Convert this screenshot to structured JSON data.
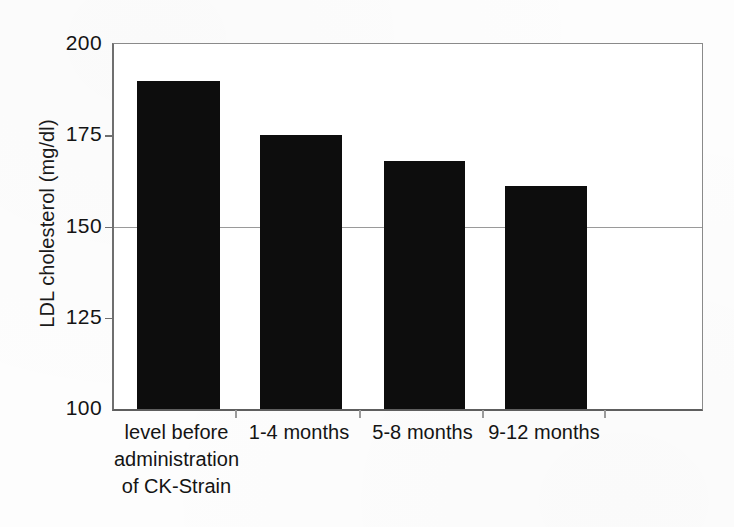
{
  "chart_data": {
    "type": "bar",
    "title": "",
    "subtitle": "",
    "xlabel": "",
    "ylabel": "LDL cholesterol (mg/dl)",
    "categories": [
      "level before administration of CK-Strain",
      "1-4 months",
      "5-8 months",
      "9-12 months"
    ],
    "category_lines": [
      [
        "level before",
        "administration",
        "of CK-Strain"
      ],
      [
        "1-4 months"
      ],
      [
        "5-8 months"
      ],
      [
        "9-12 months"
      ]
    ],
    "values": [
      190,
      175,
      168,
      161
    ],
    "ylim": [
      100,
      200
    ],
    "yticks": [
      200,
      175,
      150,
      125,
      100
    ],
    "ytick_labels": [
      "200",
      "175",
      "150",
      "125",
      "100"
    ],
    "gridlines_at": [
      150
    ],
    "grid": "single horizontal gridline at 150",
    "legend": "none",
    "legend_position": "none",
    "bar_color": "#0d0d0d",
    "axis_color": "#6f6f6f",
    "grid_color": "#9a9a9a",
    "background_color": "#ffffff"
  },
  "figure": {
    "y_axis_title": "LDL cholesterol (mg/dl)",
    "units": "mg/dl"
  }
}
